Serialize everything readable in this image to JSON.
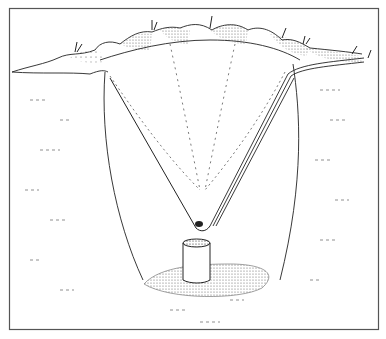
{
  "illustration": {
    "subject": "pit with funnel, tube and cylindrical container",
    "colors": {
      "ink": "#222222",
      "background": "#ffffff",
      "frame": "#555555"
    },
    "parts": [
      "frame",
      "ground-surface",
      "mounds",
      "pit-walls",
      "funnel",
      "tube",
      "drop",
      "container",
      "pit-floor"
    ]
  }
}
